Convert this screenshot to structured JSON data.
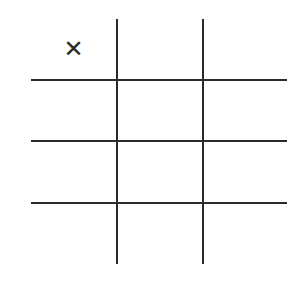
{
  "game": {
    "type": "tic-tac-toe",
    "line_color": "#2b2b2b",
    "cells": [
      {
        "row": 0,
        "col": 0,
        "mark": "✕"
      },
      {
        "row": 0,
        "col": 1,
        "mark": ""
      },
      {
        "row": 0,
        "col": 2,
        "mark": ""
      },
      {
        "row": 1,
        "col": 0,
        "mark": ""
      },
      {
        "row": 1,
        "col": 1,
        "mark": ""
      },
      {
        "row": 1,
        "col": 2,
        "mark": ""
      },
      {
        "row": 2,
        "col": 0,
        "mark": ""
      },
      {
        "row": 2,
        "col": 1,
        "mark": ""
      },
      {
        "row": 2,
        "col": 2,
        "mark": ""
      },
      {
        "row": 3,
        "col": 0,
        "mark": ""
      },
      {
        "row": 3,
        "col": 1,
        "mark": ""
      },
      {
        "row": 3,
        "col": 2,
        "mark": ""
      }
    ]
  }
}
